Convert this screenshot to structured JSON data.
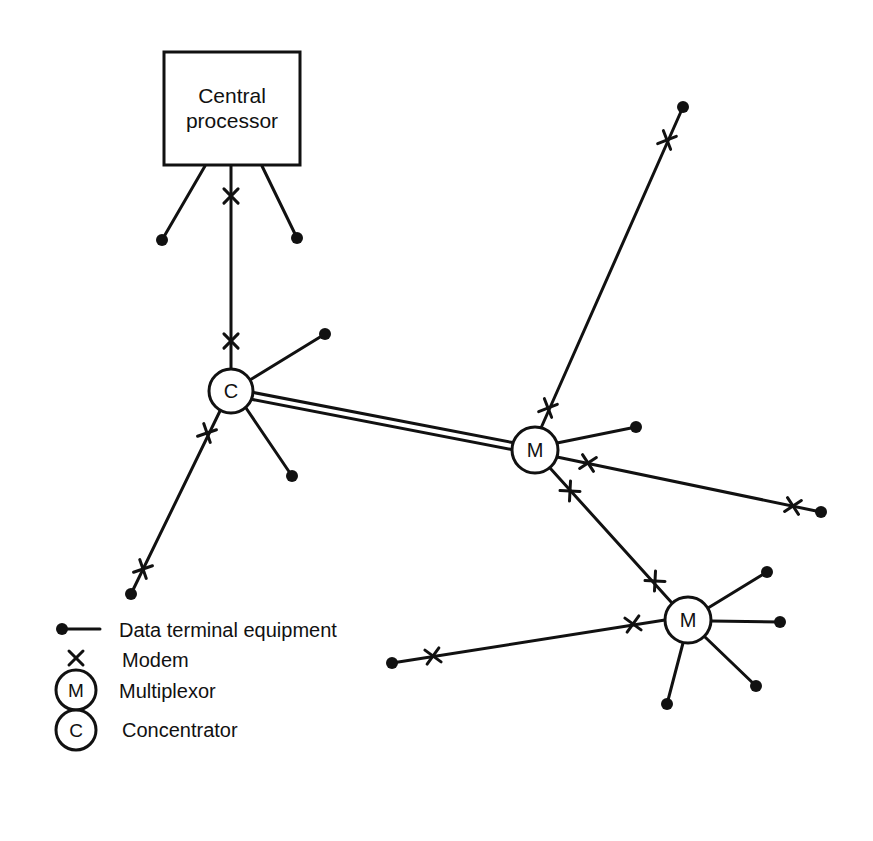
{
  "diagram": {
    "colors": {
      "ink": "#111111",
      "background": "#ffffff"
    },
    "central_processor": {
      "label_line1": "Central",
      "label_line2": "processor",
      "box": [
        164,
        52,
        136,
        113
      ]
    },
    "nodes": [
      {
        "id": "C1",
        "type": "concentrator",
        "symbol": "C",
        "x": 231,
        "y": 391,
        "r": 22
      },
      {
        "id": "M1",
        "type": "multiplexor",
        "symbol": "M",
        "x": 535,
        "y": 450,
        "r": 23
      },
      {
        "id": "M2",
        "type": "multiplexor",
        "symbol": "M",
        "x": 688,
        "y": 620,
        "r": 23
      }
    ],
    "links": [
      {
        "from": "CPU",
        "to": "DTE",
        "x1": 205,
        "y1": 166,
        "x2": 162,
        "y2": 240,
        "modems": []
      },
      {
        "from": "CPU",
        "to": "DTE",
        "x1": 262,
        "y1": 166,
        "x2": 297,
        "y2": 238,
        "modems": []
      },
      {
        "from": "CPU",
        "to": "C1",
        "x1": 231,
        "y1": 166,
        "x2": 231,
        "y2": 369,
        "modems": [
          [
            231,
            196
          ],
          [
            231,
            341
          ]
        ]
      },
      {
        "from": "C1",
        "to": "DTE",
        "x1": 250,
        "y1": 380,
        "x2": 325,
        "y2": 334,
        "modems": []
      },
      {
        "from": "C1",
        "to": "DTE",
        "x1": 246,
        "y1": 408,
        "x2": 292,
        "y2": 476,
        "modems": []
      },
      {
        "from": "C1",
        "to": "DTE",
        "x1": 220,
        "y1": 411,
        "x2": 131,
        "y2": 594,
        "modems": [
          [
            207,
            433
          ],
          [
            143,
            569
          ]
        ]
      },
      {
        "from": "C1",
        "to": "M1",
        "type": "double",
        "x1": 253,
        "y1": 396,
        "x2": 512,
        "y2": 446,
        "modems": []
      },
      {
        "from": "M1",
        "to": "DTE",
        "x1": 541,
        "y1": 428,
        "x2": 683,
        "y2": 107,
        "modems": [
          [
            548,
            408
          ],
          [
            667,
            140
          ]
        ]
      },
      {
        "from": "M1",
        "to": "DTE",
        "x1": 557,
        "y1": 443,
        "x2": 636,
        "y2": 427,
        "modems": []
      },
      {
        "from": "M1",
        "to": "DTE",
        "x1": 557,
        "y1": 457,
        "x2": 821,
        "y2": 512,
        "modems": [
          [
            588,
            463
          ],
          [
            793,
            506
          ]
        ]
      },
      {
        "from": "M1",
        "to": "M2",
        "x1": 550,
        "y1": 468,
        "x2": 672,
        "y2": 603,
        "modems": [
          [
            570,
            491
          ],
          [
            655,
            581
          ]
        ]
      },
      {
        "from": "M2",
        "to": "DTE",
        "x1": 708,
        "y1": 608,
        "x2": 767,
        "y2": 572,
        "modems": []
      },
      {
        "from": "M2",
        "to": "DTE",
        "x1": 711,
        "y1": 621,
        "x2": 780,
        "y2": 622,
        "modems": []
      },
      {
        "from": "M2",
        "to": "DTE",
        "x1": 705,
        "y1": 637,
        "x2": 756,
        "y2": 686,
        "modems": []
      },
      {
        "from": "M2",
        "to": "DTE",
        "x1": 683,
        "y1": 643,
        "x2": 667,
        "y2": 704,
        "modems": []
      },
      {
        "from": "M2",
        "to": "DTE",
        "x1": 665,
        "y1": 620,
        "x2": 392,
        "y2": 663,
        "modems": [
          [
            633,
            624
          ],
          [
            433,
            656
          ]
        ]
      }
    ],
    "terminals": [
      [
        162,
        240
      ],
      [
        297,
        238
      ],
      [
        325,
        334
      ],
      [
        292,
        476
      ],
      [
        131,
        594
      ],
      [
        683,
        107
      ],
      [
        636,
        427
      ],
      [
        821,
        512
      ],
      [
        767,
        572
      ],
      [
        780,
        622
      ],
      [
        756,
        686
      ],
      [
        667,
        704
      ],
      [
        392,
        663
      ]
    ]
  },
  "legend": {
    "items": [
      {
        "symbol": "dte",
        "label": "Data terminal equipment"
      },
      {
        "symbol": "modem",
        "label": "Modem"
      },
      {
        "symbol": "M",
        "label": "Multiplexor"
      },
      {
        "symbol": "C",
        "label": "Concentrator"
      }
    ]
  }
}
